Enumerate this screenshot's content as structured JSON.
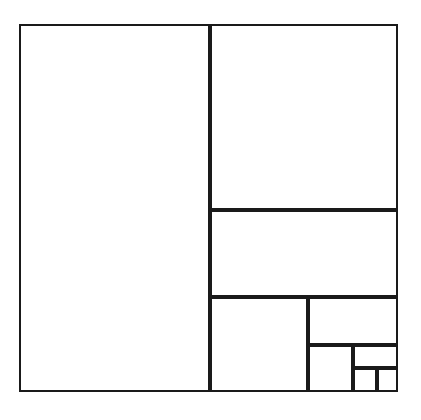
{
  "figure": {
    "background_color": "#ffffff",
    "line_color": "#1a1a1a",
    "line_width": 2,
    "fill_color": "#ffffff",
    "canvas": {
      "width": 421,
      "height": 420
    },
    "outer_frame": {
      "x": 19,
      "y": 24,
      "width": 379,
      "height": 368
    },
    "cells": [
      {
        "name": "cell-large-left",
        "x": 19,
        "y": 24,
        "width": 191,
        "height": 368
      },
      {
        "name": "cell-top-right",
        "x": 210,
        "y": 24,
        "width": 188,
        "height": 186
      },
      {
        "name": "cell-middle-right-band",
        "x": 210,
        "y": 210,
        "width": 188,
        "height": 87
      },
      {
        "name": "cell-lower-left-inner",
        "x": 210,
        "y": 297,
        "width": 98,
        "height": 95
      },
      {
        "name": "cell-lower-right-upper",
        "x": 308,
        "y": 297,
        "width": 90,
        "height": 48
      },
      {
        "name": "cell-lower-mid",
        "x": 308,
        "y": 345,
        "width": 45,
        "height": 47
      },
      {
        "name": "cell-small-wide",
        "x": 353,
        "y": 345,
        "width": 45,
        "height": 23
      },
      {
        "name": "cell-tiny-left",
        "x": 353,
        "y": 368,
        "width": 24,
        "height": 24
      },
      {
        "name": "cell-tiny-right",
        "x": 377,
        "y": 368,
        "width": 21,
        "height": 24
      }
    ]
  }
}
